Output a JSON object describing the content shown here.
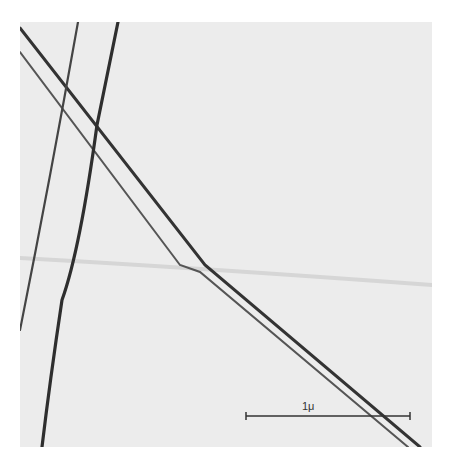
{
  "image": {
    "description": "Electron micrograph showing crossing filaments/fibers",
    "background_color": "#ececec",
    "line_color": "#3a3a3a"
  },
  "scale_bar": {
    "label": "1μ"
  }
}
